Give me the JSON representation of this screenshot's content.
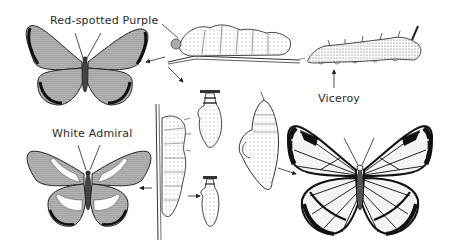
{
  "diagram": {
    "labels": {
      "red_spotted_purple": "Red-spotted Purple",
      "white_admiral": "White Admiral",
      "viceroy": "Viceroy"
    },
    "elements": [
      {
        "id": "red-spotted-purple-adult",
        "kind": "butterfly"
      },
      {
        "id": "white-admiral-adult",
        "kind": "butterfly"
      },
      {
        "id": "viceroy-adult",
        "kind": "butterfly"
      },
      {
        "id": "caterpillar-on-twig",
        "kind": "larva"
      },
      {
        "id": "viceroy-caterpillar",
        "kind": "larva"
      },
      {
        "id": "caterpillar-on-stem",
        "kind": "larva"
      },
      {
        "id": "chrysalis-small-top",
        "kind": "pupa"
      },
      {
        "id": "chrysalis-small-bottom",
        "kind": "pupa"
      },
      {
        "id": "chrysalis-large",
        "kind": "pupa"
      }
    ],
    "colors": {
      "ink": "#222222",
      "background": "#ffffff",
      "shade": "#888888"
    }
  }
}
